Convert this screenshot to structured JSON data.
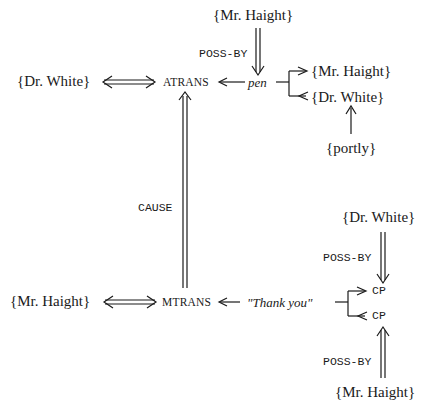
{
  "diagram": {
    "type": "conceptual-dependency",
    "top": {
      "actor": "{Dr.  White}",
      "act": "ATRANS",
      "object": "pen",
      "possessor": "{Mr.  Haight}",
      "poss_label": "POSS-BY",
      "recipient_to": "{Mr.  Haight}",
      "recipient_from": "{Dr.  White}",
      "modifier": "{portly}"
    },
    "cause_label": "CAUSE",
    "bottom": {
      "actor": "{Mr.  Haight}",
      "act": "MTRANS",
      "object": "\"Thank you\"",
      "to": "CP",
      "from": "CP",
      "to_possessor": "{Dr.  White}",
      "from_possessor": "{Mr.  Haight}",
      "poss_label_top": "POSS-BY",
      "poss_label_bottom": "POSS-BY"
    }
  }
}
